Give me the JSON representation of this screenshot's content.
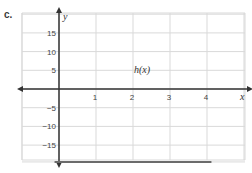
{
  "problem_label": "c.",
  "chart_data": {
    "type": "line",
    "title": "",
    "curve_label": "h(x)",
    "function": "h(x) = -5x(x-2)^2(x-4)",
    "xlabel": "x",
    "ylabel": "y",
    "xlim": [
      -1,
      5
    ],
    "ylim": [
      -20,
      20
    ],
    "x_ticks": [
      1,
      2,
      3,
      4
    ],
    "y_ticks": [
      15,
      10,
      5,
      -5,
      -10,
      -15
    ],
    "grid": true,
    "series": [
      {
        "name": "h(x)",
        "x": [
          -0.1,
          0,
          0.25,
          0.5,
          0.586,
          0.75,
          1,
          1.25,
          1.5,
          1.75,
          2,
          2.25,
          2.5,
          2.75,
          3,
          3.25,
          3.414,
          3.5,
          3.75,
          4,
          4.1
        ],
        "y": [
          -18.9,
          0,
          14.8,
          19.7,
          20,
          19.2,
          15,
          9.1,
          4.1,
          1.0,
          0,
          1.0,
          4.1,
          9.1,
          15,
          19.2,
          20,
          19.7,
          14.8,
          0,
          -18.9
        ]
      }
    ],
    "zeros": [
      0,
      2,
      4
    ],
    "local_maxima": [
      [
        0.586,
        20
      ],
      [
        3.414,
        20
      ]
    ],
    "local_minimum": [
      2,
      0
    ],
    "color": "#6b6b6b"
  }
}
